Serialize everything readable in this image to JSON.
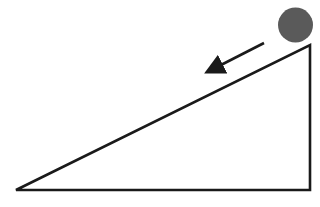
{
  "diagram": {
    "elements": {
      "incline": {
        "shape": "right-triangle",
        "stroke_color": "#1a1a1a"
      },
      "ball": {
        "shape": "circle",
        "fill_color": "#5a5a5a"
      },
      "motion_arrow": {
        "direction": "down-slope",
        "stroke_color": "#1a1a1a"
      }
    }
  }
}
